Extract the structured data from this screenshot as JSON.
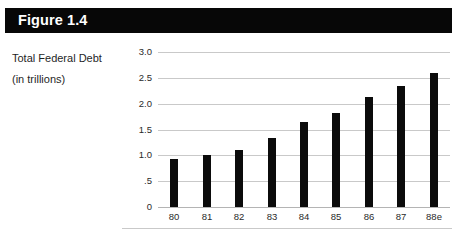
{
  "figure": {
    "title": "Figure 1.4",
    "caption_lines": [
      "Total Federal Debt",
      "(in trillions)"
    ]
  },
  "colors": {
    "title_bar_background": "#070707",
    "title_text": "#ffffff",
    "bar_fill": "#0b0b0b",
    "gridline": "#c9c9c9",
    "axis_line": "#b4b4b4",
    "page_background": "#ffffff",
    "tick_label": "#2a2a2a"
  },
  "chart_data": {
    "type": "bar",
    "title": "Figure 1.4",
    "subtitle": "Total Federal Debt (in trillions)",
    "xlabel": "",
    "ylabel": "",
    "categories": [
      "80",
      "81",
      "82",
      "83",
      "84",
      "85",
      "86",
      "87",
      "88e"
    ],
    "values": [
      0.93,
      1.0,
      1.1,
      1.33,
      1.65,
      1.82,
      2.12,
      2.35,
      2.6
    ],
    "ylim": [
      0,
      3.0
    ],
    "yticks": [
      0,
      0.5,
      1.0,
      1.5,
      2.0,
      2.5,
      3.0
    ],
    "ytick_labels": [
      "0",
      ".5",
      "1.0",
      "1.5",
      "2.0",
      "2.5",
      "3.0"
    ],
    "xtick_labels": [
      "80",
      "81",
      "82",
      "83",
      "84",
      "85",
      "86",
      "87",
      "88e"
    ],
    "grid": true,
    "grid_axis": "y",
    "legend": false,
    "series": [
      {
        "name": "Total Federal Debt",
        "values": [
          0.93,
          1.0,
          1.1,
          1.33,
          1.65,
          1.82,
          2.12,
          2.35,
          2.6
        ]
      }
    ]
  }
}
